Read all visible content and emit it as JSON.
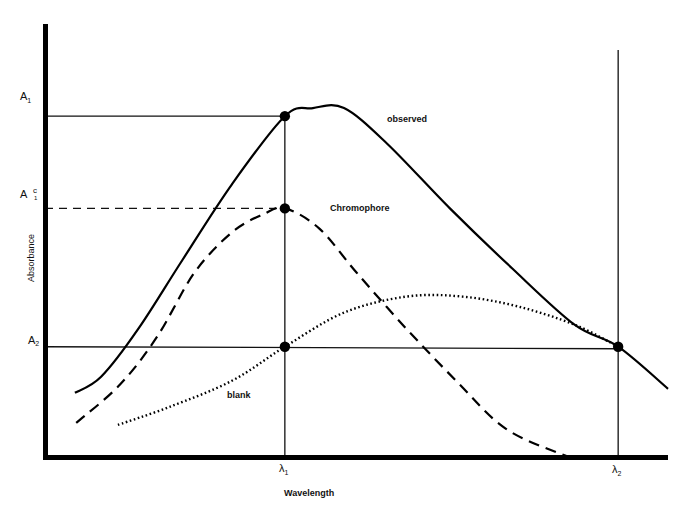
{
  "chart_data": {
    "type": "line",
    "title": "",
    "xlabel": "Wavelength",
    "ylabel": "Absorbance",
    "x_ticks": [
      {
        "id": "lambda1",
        "label": "λ",
        "subscript": "1"
      },
      {
        "id": "lambda2",
        "label": "λ",
        "subscript": "2"
      }
    ],
    "y_ticks": [
      {
        "id": "A1",
        "label": "A",
        "subscript": "1",
        "superscript": ""
      },
      {
        "id": "A1c",
        "label": "A",
        "subscript": "1",
        "superscript": "c"
      },
      {
        "id": "A2",
        "label": "A",
        "subscript": "2",
        "superscript": ""
      }
    ],
    "xlim": [
      0,
      10
    ],
    "ylim": [
      0,
      10
    ],
    "reference_values": {
      "lambda1": 3.85,
      "lambda2": 9.2,
      "A1": 8.5,
      "A1c": 6.2,
      "A2": 2.75
    },
    "series": [
      {
        "name": "observed",
        "style": "solid",
        "points": [
          [
            0.48,
            1.6
          ],
          [
            0.9,
            2.0
          ],
          [
            1.5,
            3.2
          ],
          [
            2.2,
            4.9
          ],
          [
            3.0,
            6.8
          ],
          [
            3.85,
            8.5
          ],
          [
            4.3,
            8.7
          ],
          [
            4.8,
            8.7
          ],
          [
            5.5,
            7.8
          ],
          [
            6.5,
            6.2
          ],
          [
            7.5,
            4.7
          ],
          [
            8.5,
            3.3
          ],
          [
            9.2,
            2.75
          ],
          [
            10.0,
            1.7
          ]
        ]
      },
      {
        "name": "Chromophore",
        "style": "dashed",
        "points": [
          [
            0.5,
            0.85
          ],
          [
            1.2,
            1.8
          ],
          [
            1.8,
            3.0
          ],
          [
            2.4,
            4.6
          ],
          [
            3.0,
            5.6
          ],
          [
            3.5,
            6.05
          ],
          [
            3.85,
            6.2
          ],
          [
            4.4,
            5.7
          ],
          [
            5.0,
            4.6
          ],
          [
            5.8,
            3.2
          ],
          [
            6.6,
            1.9
          ],
          [
            7.4,
            0.7
          ],
          [
            8.4,
            0.0
          ]
        ]
      },
      {
        "name": "blank",
        "style": "dotted",
        "points": [
          [
            1.17,
            0.8
          ],
          [
            2.0,
            1.25
          ],
          [
            3.0,
            1.9
          ],
          [
            3.85,
            2.75
          ],
          [
            4.8,
            3.6
          ],
          [
            5.8,
            4.0
          ],
          [
            6.7,
            4.0
          ],
          [
            7.6,
            3.75
          ],
          [
            8.5,
            3.3
          ],
          [
            9.2,
            2.75
          ]
        ]
      }
    ],
    "marked_points": [
      {
        "name": "observed-at-lambda1",
        "x": 3.85,
        "y": 8.5
      },
      {
        "name": "chromophore-at-lambda1",
        "x": 3.85,
        "y": 6.2
      },
      {
        "name": "blank-at-lambda1",
        "x": 3.85,
        "y": 2.75
      },
      {
        "name": "intersection-at-lambda2",
        "x": 9.2,
        "y": 2.75
      }
    ],
    "annotations": [
      "observed",
      "Chromophore",
      "blank"
    ],
    "grid": false,
    "legend": "none"
  }
}
